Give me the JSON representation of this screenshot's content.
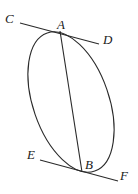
{
  "diagram": {
    "type": "geometry",
    "labels": {
      "C": "C",
      "A": "A",
      "D": "D",
      "E": "E",
      "B": "B",
      "F": "F"
    },
    "points": {
      "A": [
        60,
        32
      ],
      "B": [
        82,
        172
      ]
    },
    "segments": [
      {
        "name": "CD",
        "from": [
          20,
          23
        ],
        "to": [
          99,
          44
        ]
      },
      {
        "name": "EF",
        "from": [
          40,
          160
        ],
        "to": [
          118,
          181
        ]
      },
      {
        "name": "AB",
        "from": [
          60,
          32
        ],
        "to": [
          82,
          172
        ]
      }
    ],
    "ellipse": {
      "cx": 71,
      "cy": 102,
      "rx": 38,
      "ry": 74,
      "rotation_deg": -18
    },
    "colors": {
      "stroke": "#2a2a2a",
      "background": "#ffffff"
    }
  }
}
